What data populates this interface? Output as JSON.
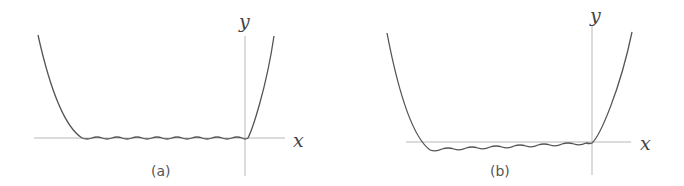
{
  "figure": {
    "panels": [
      {
        "id": "a",
        "caption": "(a)",
        "x_label": "x",
        "y_label": "y",
        "description": "Quartic-like potential well with small periodic ripples along a flat bottom lying on the x-axis"
      },
      {
        "id": "b",
        "caption": "(b)",
        "x_label": "x",
        "y_label": "y",
        "description": "Quartic-like potential well with small periodic ripples along a slightly tilted bottom, dipping below the x-axis on the left"
      }
    ]
  },
  "colors": {
    "curve": "#555555",
    "axis": "#b8b8b8",
    "background": "#ffffff"
  }
}
